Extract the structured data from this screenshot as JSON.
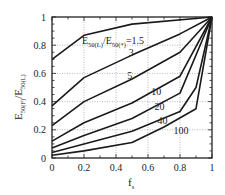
{
  "chart_data": {
    "type": "line",
    "title": "",
    "xlabel": "f_s",
    "ylabel": "E50(F)/E50(L)",
    "xlim": [
      0,
      1
    ],
    "ylim": [
      0,
      1
    ],
    "grid": true,
    "legend_position": "inline",
    "x_ticks": [
      0,
      0.2,
      0.4,
      0.6,
      0.8,
      1
    ],
    "x_tick_labels": [
      "0",
      "0.2",
      "0.4",
      "0.6",
      "0.8",
      "1"
    ],
    "y_ticks": [
      0,
      0.2,
      0.4,
      0.6,
      0.8,
      1
    ],
    "y_tick_labels": [
      "0",
      "0.2",
      "0.4",
      "0.6",
      "0.8",
      "1"
    ],
    "parameter_label": "E50(L)/E50(*)",
    "series": [
      {
        "name": "1.5",
        "label": "E50(L)/E50(*)=1.5",
        "x": [
          0,
          0.2,
          0.5,
          1
        ],
        "y": [
          0.7,
          0.87,
          0.95,
          1.0
        ],
        "label_pos": [
          0.47,
          0.8
        ]
      },
      {
        "name": "3",
        "label": "3",
        "x": [
          0,
          0.2,
          0.5,
          0.8,
          1
        ],
        "y": [
          0.37,
          0.57,
          0.73,
          0.88,
          1.0
        ],
        "label_pos": [
          0.48,
          0.72
        ]
      },
      {
        "name": "5",
        "label": "5",
        "x": [
          0,
          0.2,
          0.5,
          0.8,
          1
        ],
        "y": [
          0.23,
          0.4,
          0.56,
          0.75,
          1.0
        ],
        "label_pos": [
          0.47,
          0.56
        ]
      },
      {
        "name": "10",
        "label": "10",
        "x": [
          0,
          0.2,
          0.5,
          0.8,
          1
        ],
        "y": [
          0.12,
          0.25,
          0.39,
          0.58,
          1.0
        ],
        "label_pos": [
          0.62,
          0.45
        ]
      },
      {
        "name": "20",
        "label": "20",
        "x": [
          0,
          0.2,
          0.5,
          0.8,
          1
        ],
        "y": [
          0.07,
          0.16,
          0.28,
          0.46,
          1.0
        ],
        "label_pos": [
          0.64,
          0.34
        ]
      },
      {
        "name": "40",
        "label": "40",
        "x": [
          0,
          0.2,
          0.5,
          0.8,
          0.9,
          1
        ],
        "y": [
          0.04,
          0.1,
          0.19,
          0.33,
          0.5,
          1.0
        ],
        "label_pos": [
          0.66,
          0.24
        ]
      },
      {
        "name": "100",
        "label": "100",
        "x": [
          0,
          0.2,
          0.5,
          0.7,
          0.9,
          1
        ],
        "y": [
          0.02,
          0.05,
          0.11,
          0.22,
          0.35,
          1.0
        ],
        "label_pos": [
          0.76,
          0.17
        ]
      }
    ]
  },
  "axes": {
    "x_title_main": "f",
    "x_title_sub": "s",
    "y_title_parts": [
      "E",
      "50(F)",
      "/E",
      "50(L)"
    ]
  },
  "legend": {
    "prefix_E1": "E",
    "prefix_sub1": "50(L)",
    "prefix_E2": "/E",
    "prefix_sub2": "50(*)",
    "suffix": "=1.5"
  }
}
